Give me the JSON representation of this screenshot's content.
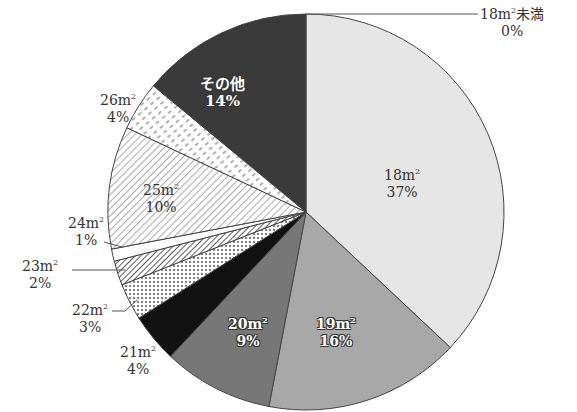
{
  "chart_data": {
    "type": "pie",
    "title": "",
    "start_angle_deg": 0,
    "direction": "clockwise",
    "categories": [
      "18m²未満",
      "18m²",
      "19m²",
      "20m²",
      "21m²",
      "22m²",
      "23m²",
      "24m²",
      "25m²",
      "26m²",
      "その他"
    ],
    "values": [
      0,
      37,
      16,
      9,
      4,
      3,
      2,
      1,
      10,
      4,
      14
    ],
    "value_unit": "%",
    "fills": [
      "#ffffff",
      "#e6e6e6",
      "#a8a8a8",
      "#777777",
      "#111111",
      "dots",
      "hatch-diag-dense",
      "#ffffff",
      "hatch-diag",
      "hatch-dash",
      "#3a3a3a"
    ],
    "legend": "none (labels placed on/near slices)"
  },
  "labels": {
    "s0": {
      "name": "18m",
      "sup": "2",
      "suffix": "未満",
      "pct": "0%"
    },
    "s1": {
      "name": "18m",
      "sup": "2",
      "pct": "37%"
    },
    "s2": {
      "name": "19m",
      "sup": "2",
      "pct": "16%"
    },
    "s3": {
      "name": "20m",
      "sup": "2",
      "pct": "9%"
    },
    "s4": {
      "name": "21m",
      "sup": "2",
      "pct": "4%"
    },
    "s5": {
      "name": "22m",
      "sup": "2",
      "pct": "3%"
    },
    "s6": {
      "name": "23m",
      "sup": "2",
      "pct": "2%"
    },
    "s7": {
      "name": "24m",
      "sup": "2",
      "pct": "1%"
    },
    "s8": {
      "name": "25m",
      "sup": "2",
      "pct": "10%"
    },
    "s9": {
      "name": "26m",
      "sup": "2",
      "pct": "4%"
    },
    "s10": {
      "name": "その他",
      "pct": "14%"
    }
  }
}
